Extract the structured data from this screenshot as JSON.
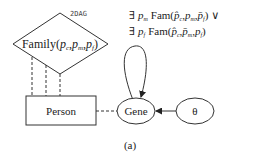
{
  "diagram": {
    "plate_label": "2DAG",
    "factor": {
      "name": "Family",
      "args": [
        "p",
        "p",
        "p"
      ],
      "subs": [
        "c",
        "m",
        "f"
      ]
    },
    "constraint": {
      "line1": {
        "q": "∃",
        "var": "p",
        "var_sub": "m",
        "fn": "Fam(",
        "a1": "p̂",
        "a1_sub": "c",
        "a2": "p",
        "a2_sub": "m",
        "a3": "p̄",
        "a3_sub": "f",
        "tail": ") ∨"
      },
      "line2": {
        "q": "∃",
        "var": "p",
        "var_sub": "f",
        "fn": "Fam(",
        "a1": "p̂",
        "a1_sub": "c",
        "a2": "p̄",
        "a2_sub": "m",
        "a3": "p",
        "a3_sub": "f",
        "tail": ")"
      }
    },
    "nodes": {
      "person": "Person",
      "gene": "Gene",
      "theta": "θ"
    },
    "caption": "(a)"
  }
}
